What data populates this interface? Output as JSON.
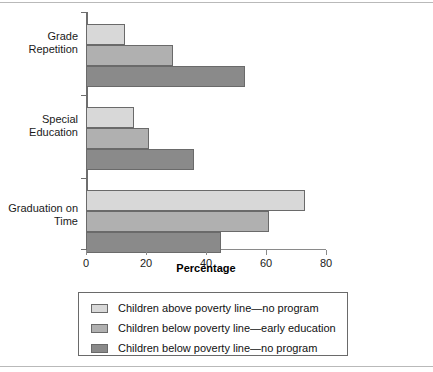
{
  "chart_data": {
    "type": "bar",
    "orientation": "horizontal",
    "title": "",
    "xlabel": "Percentage",
    "ylabel": "",
    "xlim": [
      0,
      80
    ],
    "xticks": [
      0,
      20,
      40,
      60,
      80
    ],
    "xtick_labels": [
      "0",
      "20",
      "40",
      "60",
      "80"
    ],
    "grid": false,
    "legend_position": "bottom",
    "categories": [
      "Grade Repetition",
      "Special Education",
      "Graduation on Time"
    ],
    "category_lines": [
      [
        "Grade",
        "Repetition"
      ],
      [
        "Special",
        "Education"
      ],
      [
        "Graduation on",
        "Time"
      ]
    ],
    "series": [
      {
        "name": "Children above poverty line—no program",
        "color": "#d8d8d8",
        "values": [
          13,
          16,
          73
        ]
      },
      {
        "name": "Children below poverty line—early education",
        "color": "#b0b0b0",
        "values": [
          29,
          21,
          61
        ]
      },
      {
        "name": "Children below poverty line—no program",
        "color": "#8a8a8a",
        "values": [
          53,
          36,
          45
        ]
      }
    ]
  },
  "legend": {
    "items": [
      {
        "label": "Children above poverty line—no program",
        "color": "#d8d8d8"
      },
      {
        "label": "Children below poverty line—early education",
        "color": "#b0b0b0"
      },
      {
        "label": "Children below poverty line—no program",
        "color": "#8a8a8a"
      }
    ]
  },
  "axis": {
    "x_title": "Percentage",
    "tick_labels": [
      "0",
      "20",
      "40",
      "60",
      "80"
    ]
  }
}
